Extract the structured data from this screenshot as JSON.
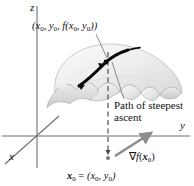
{
  "figure": {
    "axes": {
      "z_label": "z",
      "y_label": "y",
      "x_label": "x"
    },
    "labels": {
      "surface_point_prefix": "(",
      "surface_point": "(x0, y0, f(x0, y0))",
      "path_line1": "Path of steepest",
      "path_line2": "ascent",
      "gradient": "∇f(x0)",
      "base_point": "x0 = (x0, y0)"
    },
    "colors": {
      "axis": "#6f6f6f",
      "surface_fill_light": "#f2f2f2",
      "surface_fill_mid": "#e4e4e4",
      "surface_fill_dark": "#cfcfcf",
      "surface_edge": "#9a9a9a",
      "path_curve": "#0a0a0a",
      "gradient_arrow": "#8d8d8d",
      "dashed_line": "#4a4a4a",
      "leader_line": "#7a7a7a",
      "text": "#111111",
      "background": "#ffffff"
    },
    "geometry": {
      "origin_x": 37,
      "origin_y": 136,
      "z_axis_top_y": 6,
      "y_axis_right_x": 190,
      "x_axis_start": [
        58,
        117
      ],
      "x_axis_end": [
        5,
        164
      ],
      "dashed_x": 108,
      "dashed_top_y": 52,
      "dashed_bottom_y": 157,
      "gradient_tail": [
        116,
        155
      ],
      "gradient_head": [
        152,
        132
      ]
    }
  }
}
